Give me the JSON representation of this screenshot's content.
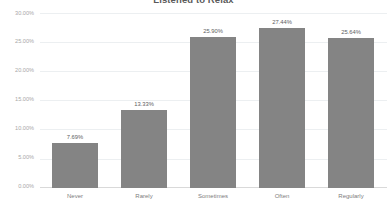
{
  "chart_data": {
    "type": "bar",
    "title": "Listened to Relax",
    "xlabel": "",
    "ylabel": "",
    "categories": [
      "Never",
      "Rarely",
      "Sometimes",
      "Often",
      "Regularly"
    ],
    "values": [
      7.69,
      13.33,
      25.9,
      27.44,
      25.64
    ],
    "value_labels": [
      "7.69%",
      "13.33%",
      "25.90%",
      "27.44%",
      "25.64%"
    ],
    "ylim": [
      0,
      30
    ],
    "ytick_values": [
      0,
      5,
      10,
      15,
      20,
      25,
      30
    ],
    "ytick_labels": [
      "0.00%",
      "5.00%",
      "10.00%",
      "15.00%",
      "20.00%",
      "25.00%",
      "30.00%"
    ],
    "grid": true,
    "legend": false,
    "bar_color": "#848484",
    "gridline_color": "#eceff1",
    "axis_color": "#d9d9d9",
    "label_color": "#a8a8a8",
    "value_label_color": "#5e5e5e",
    "title_color": "#5a5a5a",
    "background": "#ffffff"
  }
}
